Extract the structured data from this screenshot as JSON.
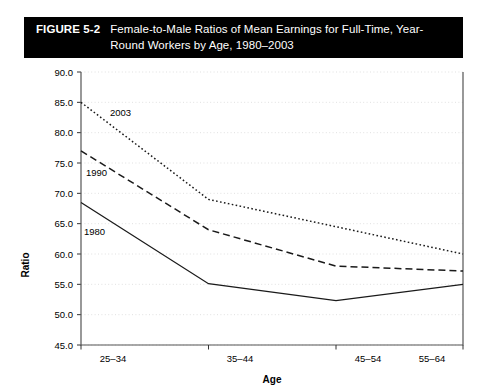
{
  "caption": {
    "figure_number": "FIGURE 5-2",
    "title": "Female-to-Male Ratios of Mean Earnings for Full-Time, Year-Round Workers by Age, 1980–2003",
    "background_color": "#000000",
    "text_color": "#ffffff"
  },
  "chart_data": {
    "type": "line",
    "title": "Female-to-Male Ratios of Mean Earnings for Full-Time, Year-Round Workers by Age, 1980–2003",
    "xlabel": "Age",
    "ylabel": "Ratio",
    "categories": [
      "25–34",
      "35–44",
      "45–54",
      "55–64"
    ],
    "ylim": [
      45.0,
      90.0
    ],
    "ytick_step": 5.0,
    "yticks": [
      "45.0",
      "50.0",
      "55.0",
      "60.0",
      "65.0",
      "70.0",
      "75.0",
      "80.0",
      "85.0",
      "90.0"
    ],
    "grid": true,
    "grid_style": "dotted",
    "grid_color": "#d9d9d9",
    "legend": "inline-labels",
    "series": [
      {
        "name": "1980",
        "label": "1980",
        "style": "solid",
        "color": "#1a1a1a",
        "values": [
          68.5,
          55.1,
          52.3,
          55.0
        ]
      },
      {
        "name": "1990",
        "label": "1990",
        "style": "dashed",
        "color": "#1a1a1a",
        "values": [
          77.0,
          64.0,
          58.0,
          57.2
        ]
      },
      {
        "name": "2003",
        "label": "2003",
        "style": "dotted",
        "color": "#1a1a1a",
        "values": [
          85.0,
          69.0,
          64.5,
          60.0
        ]
      }
    ],
    "annotations": [
      {
        "text": "2003",
        "series": "2003"
      },
      {
        "text": "1990",
        "series": "1990"
      },
      {
        "text": "1980",
        "series": "1980"
      }
    ]
  }
}
